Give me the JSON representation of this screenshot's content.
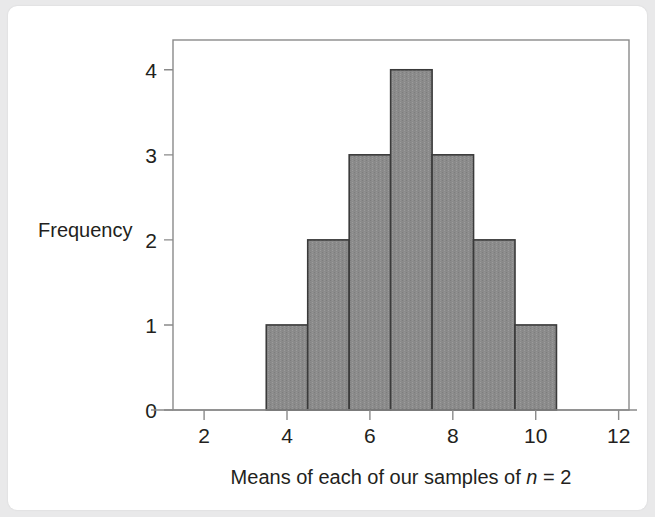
{
  "figure": {
    "background_color": "#e9e9ea",
    "card_color": "#ffffff"
  },
  "chart_data": {
    "type": "bar",
    "title": "",
    "subtitle": "",
    "xlabel_parts": {
      "before_italic": "Means of each of our samples of ",
      "italic": "n",
      "after_italic": " = 2"
    },
    "xlabel": "Means of each of our samples of n = 2",
    "ylabel": "Frequency",
    "bin_edges": [
      3.5,
      4.5,
      5.5,
      6.5,
      7.5,
      8.5,
      9.5,
      10.5
    ],
    "bin_centers": [
      4,
      5,
      6,
      7,
      8,
      9,
      10
    ],
    "values": [
      1,
      2,
      3,
      4,
      3,
      2,
      1
    ],
    "categories": [
      "3.5-4.5",
      "4.5-5.5",
      "5.5-6.5",
      "6.5-7.5",
      "7.5-8.5",
      "8.5-9.5",
      "9.5-10.5"
    ],
    "xlim": [
      1.25,
      12.25
    ],
    "ylim": [
      0,
      4.35
    ],
    "xticks": [
      2,
      4,
      6,
      8,
      10,
      12
    ],
    "xticklabels": [
      "2",
      "4",
      "6",
      "8",
      "10",
      "12"
    ],
    "yticks": [
      0,
      1,
      2,
      3,
      4
    ],
    "yticklabels": [
      "0",
      "1",
      "2",
      "3",
      "4"
    ],
    "grid": false,
    "legend": false,
    "legend_position": "none",
    "bar_fill_color": "#8b8b8b",
    "bar_edge_color": "#3a3a3a",
    "axis_color": "#8a8a8a",
    "text_color": "#231f20"
  }
}
